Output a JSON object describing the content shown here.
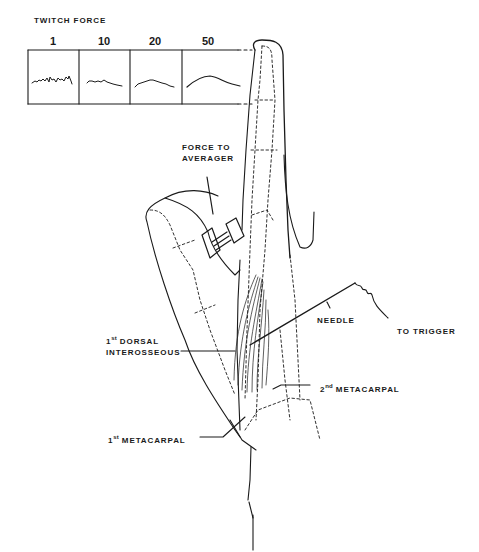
{
  "figure": {
    "title": "TWITCH FORCE",
    "panels": [
      {
        "label": "1",
        "trace": "noisy-flat"
      },
      {
        "label": "10",
        "trace": "slightly-smoothed"
      },
      {
        "label": "20",
        "trace": "smoothed-hump"
      },
      {
        "label": "50",
        "trace": "smooth-hump"
      }
    ],
    "labels": {
      "force_to_averager_line1": "FORCE TO",
      "force_to_averager_line2": "AVERAGER",
      "needle": "NEEDLE",
      "to_trigger": "TO TRIGGER",
      "dorsal_sup": "st",
      "dorsal_num": "1",
      "dorsal_line1": " DORSAL",
      "dorsal_line2": "INTEROSSEOUS",
      "meta2_num": "2",
      "meta2_sup": "nd",
      "meta2_text": " METACARPAL",
      "meta1_num": "1",
      "meta1_sup": "st",
      "meta1_text": " METACARPAL"
    },
    "colors": {
      "ink": "#1a1a1a",
      "background": "#ffffff"
    }
  }
}
